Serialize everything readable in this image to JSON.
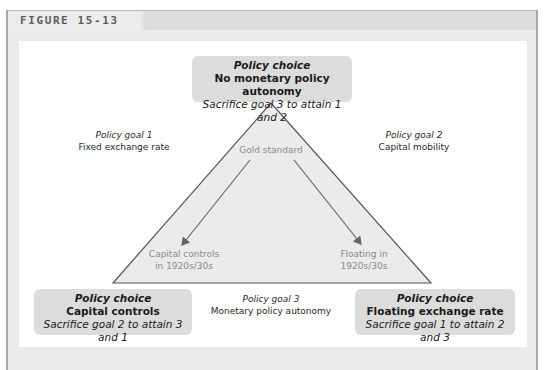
{
  "figure": {
    "label": "FIGURE 15-13"
  },
  "diagram": {
    "type": "policy-trilemma-triangle",
    "colors": {
      "box_fill": "#dcdcdc",
      "triangle_fill": "#ebebeb",
      "triangle_stroke": "#555555",
      "arrow": "#666666",
      "inner_text": "#8a8a8a"
    },
    "top_choice": {
      "heading": "Policy choice",
      "title": "No monetary policy autonomy",
      "subtitle": "Sacrifice goal 3 to attain 1 and 2"
    },
    "left_choice": {
      "heading": "Policy choice",
      "title": "Capital controls",
      "subtitle": "Sacrifice goal 2 to attain 3 and 1"
    },
    "right_choice": {
      "heading": "Policy choice",
      "title": "Floating exchange rate",
      "subtitle": "Sacrifice goal 1 to attain 2 and 3"
    },
    "goals": {
      "goal1": {
        "label": "Policy goal 1",
        "name": "Fixed exchange rate"
      },
      "goal2": {
        "label": "Policy goal 2",
        "name": "Capital mobility"
      },
      "goal3": {
        "label": "Policy goal 3",
        "name": "Monetary policy autonomy"
      }
    },
    "inner_labels": {
      "apex": "Gold standard",
      "left_line1": "Capital controls",
      "left_line2": "in 1920s/30s",
      "right_line1": "Floating in",
      "right_line2": "1920s/30s"
    },
    "arrows": [
      {
        "from": "Gold standard",
        "to": "Capital controls in 1920s/30s"
      },
      {
        "from": "Gold standard",
        "to": "Floating in 1920s/30s"
      }
    ]
  }
}
